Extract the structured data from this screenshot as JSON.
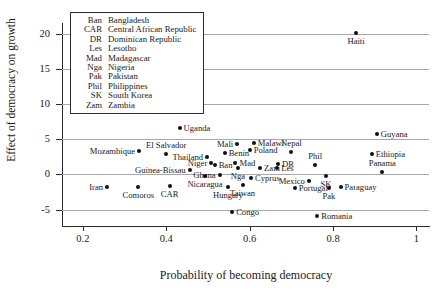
{
  "chart_data": {
    "type": "scatter",
    "title": "",
    "xlabel": "Probability of becoming democracy",
    "ylabel": "Effect of democracy on growth",
    "xlim": [
      0.15,
      1.03
    ],
    "ylim": [
      -6.2,
      21.5
    ],
    "xticks": [
      0.2,
      0.4,
      0.6,
      0.8,
      1
    ],
    "xtick_labels": [
      "0.2",
      "0.4",
      "0.6",
      "0.8",
      "1"
    ],
    "yticks": [
      -5,
      0,
      5,
      10,
      15,
      20
    ],
    "ytick_labels": [
      "-5",
      "0",
      "5",
      "10",
      "15",
      "20"
    ],
    "grid": "horizontal",
    "legend_position": "top-left-inset",
    "points": [
      {
        "label": "Haiti",
        "x": 0.855,
        "y": 20.1,
        "pos": "b"
      },
      {
        "label": "Uganda",
        "x": 0.432,
        "y": 6.55,
        "pos": "r"
      },
      {
        "label": "Guyana",
        "x": 0.905,
        "y": 5.75,
        "pos": "r"
      },
      {
        "label": "Mali",
        "x": 0.57,
        "y": 4.25,
        "pos": "l"
      },
      {
        "label": "Malawi",
        "x": 0.61,
        "y": 4.45,
        "pos": "r"
      },
      {
        "label": "Mozambique",
        "x": 0.335,
        "y": 3.35,
        "pos": "l"
      },
      {
        "label": "El Salvador",
        "x": 0.4,
        "y": 2.85,
        "pos": "t"
      },
      {
        "label": "Thailand",
        "x": 0.498,
        "y": 2.45,
        "pos": "l"
      },
      {
        "label": "Benin",
        "x": 0.54,
        "y": 3.1,
        "pos": "r"
      },
      {
        "label": "Poland",
        "x": 0.6,
        "y": 3.4,
        "pos": "r"
      },
      {
        "label": "Nepal",
        "x": 0.7,
        "y": 3.2,
        "pos": "t"
      },
      {
        "label": "Ethiopia",
        "x": 0.893,
        "y": 2.85,
        "pos": "r"
      },
      {
        "label": "Niger",
        "x": 0.508,
        "y": 1.6,
        "pos": "l"
      },
      {
        "label": "Ban",
        "x": 0.516,
        "y": 1.3,
        "pos": "r"
      },
      {
        "label": "Mad",
        "x": 0.566,
        "y": 1.65,
        "pos": "r"
      },
      {
        "label": "Nga",
        "x": 0.572,
        "y": 0.85,
        "pos": "b"
      },
      {
        "label": "Zam",
        "x": 0.625,
        "y": 0.95,
        "pos": "r"
      },
      {
        "label": "DR",
        "x": 0.668,
        "y": 1.5,
        "pos": "r"
      },
      {
        "label": "Les",
        "x": 0.666,
        "y": 0.9,
        "pos": "r"
      },
      {
        "label": "Phil",
        "x": 0.757,
        "y": 1.3,
        "pos": "t"
      },
      {
        "label": "Panama",
        "x": 0.918,
        "y": 0.3,
        "pos": "t"
      },
      {
        "label": "Guinea-Bissau",
        "x": 0.456,
        "y": 0.55,
        "pos": "l"
      },
      {
        "label": "Ghana",
        "x": 0.528,
        "y": -0.15,
        "pos": "l"
      },
      {
        "label": "Cyprus",
        "x": 0.603,
        "y": -0.55,
        "pos": "r"
      },
      {
        "label": "SK",
        "x": 0.783,
        "y": -0.3,
        "pos": "b"
      },
      {
        "label": "Mexico",
        "x": 0.742,
        "y": -0.95,
        "pos": "l"
      },
      {
        "label": "Nicaragua",
        "x": 0.493,
        "y": -0.25,
        "pos": "b"
      },
      {
        "label": "Taiwan",
        "x": 0.583,
        "y": -1.45,
        "pos": "b"
      },
      {
        "label": "Iran",
        "x": 0.258,
        "y": -1.85,
        "pos": "l"
      },
      {
        "label": "Comoros",
        "x": 0.333,
        "y": -1.8,
        "pos": "b"
      },
      {
        "label": "CAR",
        "x": 0.408,
        "y": -1.65,
        "pos": "b"
      },
      {
        "label": "Hungary",
        "x": 0.548,
        "y": -1.75,
        "pos": "b"
      },
      {
        "label": "Portugal",
        "x": 0.708,
        "y": -2.0,
        "pos": "r"
      },
      {
        "label": "Pak",
        "x": 0.79,
        "y": -1.95,
        "pos": "b"
      },
      {
        "label": "Paraguay",
        "x": 0.818,
        "y": -1.85,
        "pos": "r"
      },
      {
        "label": "Congo",
        "x": 0.558,
        "y": -5.35,
        "pos": "r"
      },
      {
        "label": "Romania",
        "x": 0.762,
        "y": -5.95,
        "pos": "r"
      }
    ],
    "legend_entries": [
      {
        "abbr": "Ban",
        "full": "Bangladesh"
      },
      {
        "abbr": "CAR",
        "full": "Central African Republic"
      },
      {
        "abbr": "DR",
        "full": "Dominican Republic"
      },
      {
        "abbr": "Les",
        "full": "Lesotho"
      },
      {
        "abbr": "Mad",
        "full": "Madagascar"
      },
      {
        "abbr": "Nga",
        "full": "Nigeria"
      },
      {
        "abbr": "Pak",
        "full": "Pakistan"
      },
      {
        "abbr": "Phil",
        "full": "Philippines"
      },
      {
        "abbr": "SK",
        "full": "South Korea"
      },
      {
        "abbr": "Zam",
        "full": "Zambia"
      }
    ],
    "colors": {
      "point": "#111111",
      "grid": "#a8a8a8",
      "axis": "#2b2b2b",
      "text": "#1a1a1a"
    }
  }
}
